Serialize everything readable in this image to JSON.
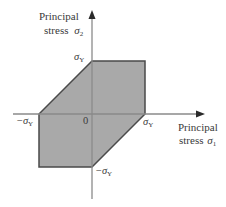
{
  "diagram": {
    "type": "yield-surface",
    "axes": {
      "y": {
        "label_line1": "Principal",
        "label_line2": "stress",
        "symbol": "σ",
        "subscript": "2"
      },
      "x": {
        "label_line1": "Principal",
        "label_line2": "stress",
        "symbol": "σ",
        "subscript": "1"
      }
    },
    "tick_labels": {
      "top": {
        "symbol": "σ",
        "subscript": "Y"
      },
      "right": {
        "symbol": "σ",
        "subscript": "Y"
      },
      "left": {
        "prefix": "−",
        "symbol": "σ",
        "subscript": "Y"
      },
      "bottom": {
        "prefix": "−",
        "symbol": "σ",
        "subscript": "Y"
      },
      "origin": "0"
    },
    "region": {
      "shape": "hexagon",
      "vertices": [
        [
          0,
          1
        ],
        [
          1,
          1
        ],
        [
          1,
          0
        ],
        [
          0,
          -1
        ],
        [
          -1,
          -1
        ],
        [
          -1,
          0
        ]
      ],
      "fill_color": "#a9a9a9",
      "stroke_color": "#4a4a4a"
    },
    "colors": {
      "axis": "#8a8a8a",
      "arrow": "#2a2a2a",
      "text": "#3a3a3a"
    }
  }
}
